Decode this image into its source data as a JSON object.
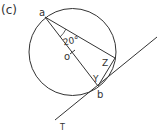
{
  "figure": {
    "panel_label": "(c)",
    "angle_label": "20°",
    "points": {
      "a": "a",
      "o": "o",
      "b": "b",
      "t": "T"
    },
    "angle_marks": {
      "y": "Y",
      "z": "Z"
    }
  },
  "colors": {
    "stroke": "#333333",
    "background": "#ffffff"
  }
}
